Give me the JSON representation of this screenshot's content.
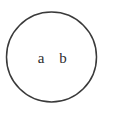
{
  "figure": {
    "name": "venn-style-single-set-diagram",
    "background_color": "#ffffff",
    "width": 113,
    "height": 116,
    "stroke_color": "#3a3a3a",
    "text_color": "#2e2e2e"
  },
  "circle": {
    "name": "set-circle",
    "center_x": 51.5,
    "center_y": 57,
    "radius": 45,
    "stroke_width": 1.5,
    "fill": "none"
  },
  "labels": [
    {
      "text": "a",
      "x": 41,
      "y": 63,
      "font_size": 15
    },
    {
      "text": "b",
      "x": 63,
      "y": 63,
      "font_size": 15
    }
  ]
}
